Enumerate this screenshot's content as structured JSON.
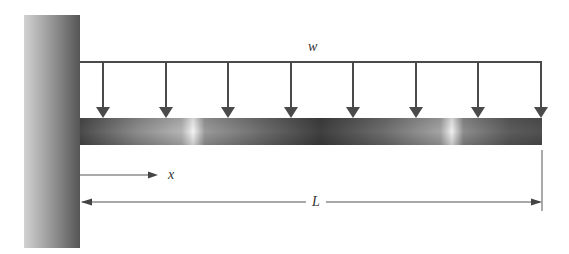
{
  "diagram": {
    "type": "cantilever-beam-uniform-load",
    "labels": {
      "load": "w",
      "position": "x",
      "length": "L"
    },
    "colors": {
      "line": "#4a4a4a",
      "wall_light": "#c8c8c8",
      "wall_dark": "#5a5a5a",
      "beam_dark": "#4f4f4f",
      "beam_highlight": "#f2f2f2"
    },
    "load_arrow_count": 8
  }
}
